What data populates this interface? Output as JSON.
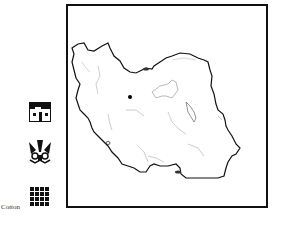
{
  "legend": {
    "items": [
      {
        "icon": "house-icon",
        "label": ""
      },
      {
        "icon": "mask-icon",
        "label": ""
      },
      {
        "icon": "grid-icon",
        "label": "Cotton"
      }
    ]
  },
  "map": {
    "region": "Iran outline",
    "marker": "capital-dot",
    "colors": {
      "border": "#111111",
      "rivers": "#aaaaaa",
      "marker": "#000000"
    }
  }
}
